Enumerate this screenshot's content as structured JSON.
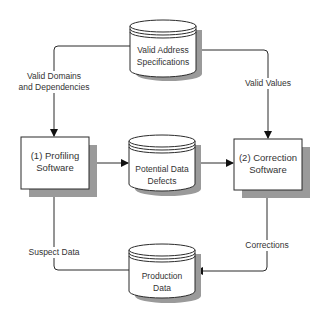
{
  "nodes": {
    "valid_address_specs": {
      "line1": "Valid Address",
      "line2": "Specifications",
      "shape": "cylinder"
    },
    "profiling_software": {
      "line1": "(1) Profiling",
      "line2": "Software",
      "shape": "box"
    },
    "potential_defects": {
      "line1": "Potential Data",
      "line2": "Defects",
      "shape": "cylinder"
    },
    "correction_software": {
      "line1": "(2) Correction",
      "line2": "Software",
      "shape": "box"
    },
    "production_data": {
      "line1": "Production",
      "line2": "Data",
      "shape": "cylinder"
    }
  },
  "edges": {
    "valid_domains": {
      "line1": "Valid Domains",
      "line2": "and Dependencies"
    },
    "valid_values": {
      "label": "Valid Values"
    },
    "suspect_data": {
      "label": "Suspect Data"
    },
    "corrections": {
      "label": "Corrections"
    }
  },
  "colors": {
    "stroke": "#2b2b2b",
    "shadow": "#9a9a9a",
    "fill": "#ffffff",
    "text": "#333333"
  }
}
